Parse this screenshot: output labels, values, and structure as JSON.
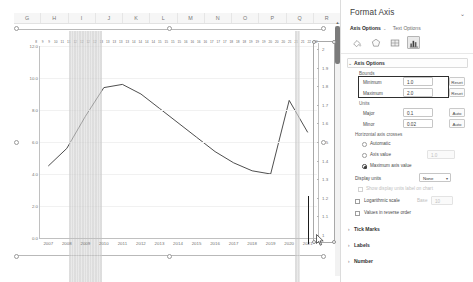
{
  "spreadsheet": {
    "column_headers": [
      "G",
      "H",
      "I",
      "J",
      "K",
      "L",
      "M",
      "N",
      "O",
      "P",
      "Q",
      "R"
    ]
  },
  "chart_data": {
    "type": "line",
    "title": "",
    "xlabel": "",
    "ylabel": "",
    "grid": true,
    "legend_position": "none",
    "x": [
      2007,
      2008,
      2009,
      2010,
      2011,
      2012,
      2013,
      2014,
      2015,
      2016,
      2017,
      2018,
      2019,
      2020,
      2021
    ],
    "primary_axis": {
      "ylim": [
        0.0,
        12.0
      ],
      "ticks": [
        "12.0",
        "10.0",
        "8.0",
        "6.0",
        "4.0",
        "2.0",
        "0.0"
      ],
      "tick_values": [
        12.0,
        10.0,
        8.0,
        6.0,
        4.0,
        2.0,
        0.0
      ]
    },
    "secondary_axis": {
      "ylim": [
        1.0,
        2.0
      ],
      "ticks": [
        "2",
        "1.9",
        "1.8",
        "1.7",
        "1.6",
        "1.5",
        "1.4",
        "1.3",
        "1.2",
        "1.1",
        "1"
      ],
      "tick_values": [
        2,
        1.9,
        1.8,
        1.7,
        1.6,
        1.5,
        1.4,
        1.3,
        1.2,
        1.1,
        1
      ],
      "selected": true
    },
    "series": [
      {
        "name": "Series 1",
        "values": [
          4.5,
          5.6,
          7.6,
          9.4,
          9.6,
          9.0,
          8.1,
          7.2,
          6.3,
          5.4,
          4.7,
          4.2,
          4.0,
          8.6,
          6.6
        ]
      }
    ],
    "shaded_bands": [
      {
        "from": 2008.1,
        "to": 2009.9,
        "label": "selected-columns-band"
      },
      {
        "from": 2020.3,
        "to": 2020.6,
        "label": "selected-columns-band"
      }
    ],
    "data_label_strip": [
      "8",
      "9",
      "9",
      "10",
      "11",
      "11",
      "12",
      "12",
      "12",
      "12",
      "13",
      "13",
      "13",
      "13",
      "13",
      "14",
      "14",
      "14",
      "14",
      "15",
      "15",
      "15",
      "15",
      "16",
      "16",
      "16",
      "16",
      "17",
      "17",
      "17",
      "18",
      "18",
      "18",
      "19",
      "19",
      "19",
      "20",
      "20",
      "20",
      "21",
      "21",
      "21",
      "22",
      "22"
    ]
  },
  "pane": {
    "title": "Format Axis",
    "collapse_icon": "chevron-down-icon",
    "tabs": [
      {
        "label": "Axis Options",
        "active": true,
        "caret": "⌄"
      },
      {
        "label": "Text Options",
        "active": false
      }
    ],
    "icons": [
      {
        "name": "fill-icon",
        "selected": false
      },
      {
        "name": "effects-icon",
        "selected": false
      },
      {
        "name": "size-properties-icon",
        "selected": false
      },
      {
        "name": "axis-options-chart-icon",
        "selected": true
      }
    ],
    "sections": {
      "axis_options": {
        "header": "Axis Options",
        "expanded": true,
        "bounds": {
          "group_label": "Bounds",
          "highlighted": true,
          "rows": [
            {
              "label": "Minimum",
              "value": "1.0",
              "button": "Reset"
            },
            {
              "label": "Maximum",
              "value": "2.0",
              "button": "Reset"
            }
          ]
        },
        "units": {
          "group_label": "Units",
          "rows": [
            {
              "label": "Major",
              "value": "0.1",
              "button": "Auto"
            },
            {
              "label": "Minor",
              "value": "0.02",
              "button": "Auto"
            }
          ]
        },
        "horizontal_axis_crosses": {
          "group_label": "Horizontal axis crosses",
          "options": [
            {
              "label": "Automatic",
              "selected": false
            },
            {
              "label": "Axis value",
              "selected": false,
              "value": "1.0",
              "value_disabled": true
            },
            {
              "label": "Maximum axis value",
              "selected": true
            }
          ]
        },
        "display_units": {
          "label": "Display units",
          "value": "None",
          "checkbox": {
            "label": "Show display units label on chart",
            "checked": false,
            "disabled": true
          }
        },
        "log_scale": {
          "label": "Logarithmic scale",
          "checked": false,
          "base_label": "Base",
          "base_value": "10",
          "base_disabled": true
        },
        "reverse_order": {
          "label": "Values in reverse order",
          "checked": false
        }
      },
      "tick_marks": {
        "header": "Tick Marks",
        "expanded": false
      },
      "labels": {
        "header": "Labels",
        "expanded": false
      },
      "number": {
        "header": "Number",
        "expanded": false
      }
    }
  },
  "colors": {
    "line": "#3a3a3a",
    "band": "#cfcfcf",
    "pane_bg": "#ffffff",
    "accent_border": "#2f2f2f",
    "grid": "#f1f1f1",
    "axis": "#c0c0c0"
  }
}
